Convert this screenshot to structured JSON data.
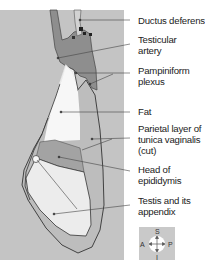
{
  "figure": {
    "type": "anatomical-diagram",
    "colors": {
      "panel_background": "#c4c4c4",
      "muscle_vessels": "#8e8e8e",
      "fat": "#f7f7f7",
      "tunica": "#bdbdbd",
      "epididymis": "#a3a3a3",
      "testis": "#ececec",
      "outline": "#333333",
      "leader_lines": "#444444"
    },
    "labels": [
      {
        "id": "ductus-deferens",
        "lines": [
          "Ductus deferens"
        ]
      },
      {
        "id": "testicular-artery",
        "lines": [
          "Testicular",
          "artery"
        ]
      },
      {
        "id": "pampiniform-plexus",
        "lines": [
          "Pampiniform",
          "plexus"
        ]
      },
      {
        "id": "fat",
        "lines": [
          "Fat"
        ]
      },
      {
        "id": "parietal-layer",
        "lines": [
          "Parietal layer of",
          "tunica vaginalis",
          "(cut)"
        ]
      },
      {
        "id": "head-of-epididymis",
        "lines": [
          "Head of",
          "epididymis"
        ]
      },
      {
        "id": "testis-appendix",
        "lines": [
          "Testis and its",
          "appendix"
        ]
      }
    ],
    "compass": {
      "superior": "S",
      "inferior": "I",
      "anterior": "A",
      "posterior": "P"
    }
  }
}
